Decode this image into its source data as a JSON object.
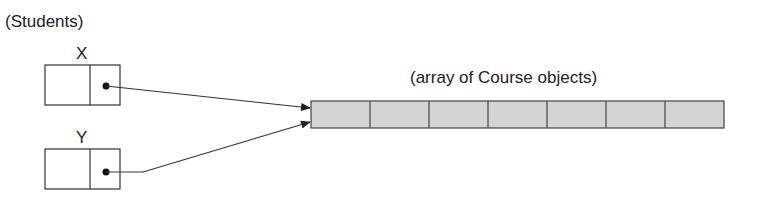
{
  "diagram": {
    "group_label": "(Students)",
    "variables": [
      {
        "name": "X"
      },
      {
        "name": "Y"
      }
    ],
    "array_label": "(array of Course objects)",
    "array_cell_count": 7,
    "colors": {
      "stroke": "#333333",
      "array_fill": "#d4d4d4"
    }
  }
}
